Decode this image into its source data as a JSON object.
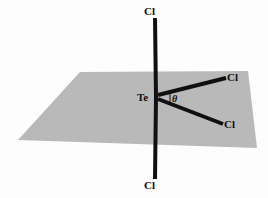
{
  "figure": {
    "kind": "molecular-geometry-diagram",
    "background_color": "#fdfdfd",
    "plane": {
      "name": "equatorial-plane",
      "fill_color": "#b9b9b9",
      "points": "80,72 248,71 257,148 18,140"
    },
    "bonds": {
      "color": "#101010",
      "width": 4,
      "items": [
        {
          "name": "bond-te-cl-top",
          "x1": 156,
          "y1": 97,
          "x2": 155,
          "y2": 18
        },
        {
          "name": "bond-te-cl-bottom",
          "x1": 156,
          "y1": 97,
          "x2": 155,
          "y2": 179
        },
        {
          "name": "bond-te-cl-upper-right",
          "x1": 158,
          "y1": 95,
          "x2": 226,
          "y2": 78
        },
        {
          "name": "bond-te-cl-lower-right",
          "x1": 158,
          "y1": 99,
          "x2": 223,
          "y2": 124
        }
      ]
    },
    "angle_marker": {
      "name": "angle-tick",
      "x1": 170,
      "y1": 93,
      "x2": 170,
      "y2": 105,
      "color": "#101010",
      "width": 1
    },
    "labels": {
      "cl_top": "Cl",
      "cl_bottom": "Cl",
      "te_center": "Te",
      "cl_upper_right": "Cl",
      "cl_lower_right": "Cl",
      "theta": "θ"
    }
  }
}
